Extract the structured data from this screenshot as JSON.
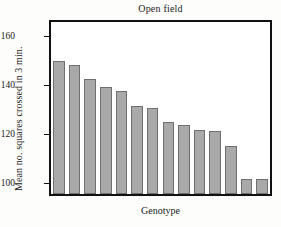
{
  "figure": {
    "title": "Open field",
    "xlabel": "Genotype",
    "ylabel": "Mean no. squares crossed in 3 min."
  },
  "axis": {
    "y_ticks": [
      {
        "value": 160,
        "label": "160"
      },
      {
        "value": 140,
        "label": "140"
      },
      {
        "value": 120,
        "label": "120"
      },
      {
        "value": 100,
        "label": "100"
      }
    ]
  },
  "colors": {
    "bar_fill": "#a9a9a9",
    "bar_edge": "#6f6f6f",
    "frame": "#111111",
    "text": "#1a1a1a",
    "background": "#ffffff"
  },
  "chart_data": {
    "type": "bar",
    "title": "Open field",
    "xlabel": "Genotype",
    "ylabel": "Mean no. squares crossed in 3 min.",
    "categories": [
      "1",
      "2",
      "3",
      "4",
      "5",
      "6",
      "7",
      "8",
      "9",
      "10",
      "11",
      "12",
      "13",
      "14"
    ],
    "values": [
      150,
      148.5,
      143,
      139.5,
      138,
      132,
      131,
      125.5,
      124,
      122,
      121.5,
      115.5,
      102,
      102
    ],
    "ylim": [
      96,
      166
    ],
    "yticks": [
      100,
      120,
      140,
      160
    ],
    "xticks": [],
    "xtick_labels": [],
    "grid": false,
    "legend": false
  }
}
